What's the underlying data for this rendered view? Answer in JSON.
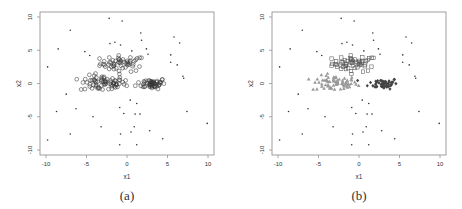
{
  "figure": {
    "panels": [
      {
        "caption": "(a)",
        "xlabel": "x1",
        "ylabel": "x2"
      },
      {
        "caption": "(b)",
        "xlabel": "x1",
        "ylabel": "x2"
      }
    ]
  },
  "chart_data": [
    {
      "type": "scatter",
      "title": "",
      "caption": "(a)",
      "xlabel": "x1",
      "ylabel": "x2",
      "xlim": [
        -10,
        10
      ],
      "ylim": [
        -10,
        10
      ],
      "xticks": [
        "-10",
        "-5",
        "0",
        "5",
        "10"
      ],
      "yticks": [
        "-10",
        "-5",
        "0",
        "5",
        "10"
      ],
      "grid": false,
      "legend": null,
      "series": [
        {
          "name": "cluster-upper",
          "marker": "circle-open",
          "color": "#333333",
          "center": [
            -0.5,
            3
          ],
          "spread": [
            2,
            0.6
          ]
        },
        {
          "name": "cluster-left",
          "marker": "circle-open",
          "color": "#333333",
          "center": [
            -3,
            0
          ],
          "spread": [
            2,
            0.6
          ]
        },
        {
          "name": "cluster-right",
          "marker": "circle-open",
          "color": "#333333",
          "center": [
            3,
            0
          ],
          "spread": [
            1.3,
            0.4
          ]
        },
        {
          "name": "noise",
          "marker": "dot",
          "color": "#333333",
          "points": [
            [
              -9.8,
              -8.5
            ],
            [
              -9.8,
              2.5
            ],
            [
              -8.5,
              5.2
            ],
            [
              -8.7,
              -4.2
            ],
            [
              -7,
              8
            ],
            [
              -7,
              -7.6
            ],
            [
              -7.5,
              -1.6
            ],
            [
              -6.3,
              -3.8
            ],
            [
              -5.2,
              4.8
            ],
            [
              -4.6,
              4.2
            ],
            [
              -4.2,
              -5
            ],
            [
              -3.2,
              -6.5
            ],
            [
              -2.2,
              9.8
            ],
            [
              -2.1,
              6
            ],
            [
              -1.5,
              6.2
            ],
            [
              -0.9,
              -3.6
            ],
            [
              -0.8,
              -7.6
            ],
            [
              -0.9,
              -9.2
            ],
            [
              -0.6,
              9.4
            ],
            [
              -0.4,
              -4.5
            ],
            [
              -0.8,
              5.8
            ],
            [
              0.4,
              -2.5
            ],
            [
              0.5,
              -7.3
            ],
            [
              0.6,
              4.9
            ],
            [
              1,
              -4.6
            ],
            [
              1.2,
              -3
            ],
            [
              1.2,
              -9.2
            ],
            [
              1.7,
              7.6
            ],
            [
              1.8,
              6.5
            ],
            [
              1.6,
              -4.6
            ],
            [
              0.9,
              -6.5
            ],
            [
              2.4,
              5.2
            ],
            [
              2.8,
              -7.1
            ],
            [
              2.6,
              4.4
            ],
            [
              4.4,
              -8.3
            ],
            [
              5.4,
              4.3
            ],
            [
              5.4,
              3.2
            ],
            [
              5.8,
              7
            ],
            [
              6.2,
              2.8
            ],
            [
              6.5,
              6.1
            ],
            [
              6.9,
              1.1
            ],
            [
              7,
              0.8
            ],
            [
              7.4,
              -4.2
            ],
            [
              9.9,
              -6
            ]
          ]
        }
      ]
    },
    {
      "type": "scatter",
      "title": "",
      "caption": "(b)",
      "xlabel": "x1",
      "ylabel": "x2",
      "xlim": [
        -10,
        10
      ],
      "ylim": [
        -10,
        10
      ],
      "xticks": [
        "-10",
        "-5",
        "0",
        "5",
        "10"
      ],
      "yticks": [
        "-10",
        "-5",
        "0",
        "5",
        "10"
      ],
      "grid": false,
      "legend": null,
      "series": [
        {
          "name": "cluster-upper",
          "marker": "square-open",
          "color": "#555555",
          "center": [
            -0.5,
            3
          ],
          "spread": [
            2,
            0.6
          ]
        },
        {
          "name": "cluster-left",
          "marker": "triangle-filled",
          "color": "#999999",
          "center": [
            -3,
            0
          ],
          "spread": [
            2,
            0.6
          ]
        },
        {
          "name": "cluster-right",
          "marker": "diamond-filled",
          "color": "#444444",
          "center": [
            3,
            0
          ],
          "spread": [
            1.3,
            0.4
          ]
        },
        {
          "name": "noise",
          "marker": "dot",
          "color": "#333333",
          "points": "same as (a)"
        }
      ]
    }
  ]
}
